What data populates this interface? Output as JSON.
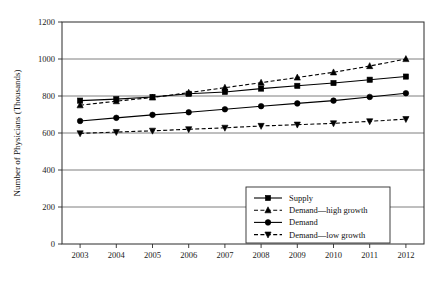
{
  "chart_data": {
    "type": "line",
    "title": "",
    "xlabel": "",
    "ylabel": "Number of Physicians (Thousands)",
    "categories": [
      2003,
      2004,
      2005,
      2006,
      2007,
      2008,
      2009,
      2010,
      2011,
      2012
    ],
    "x_tick_labels": [
      "2003",
      "2004",
      "2005",
      "2006",
      "2007",
      "2008",
      "2009",
      "2010",
      "2011",
      "2012"
    ],
    "y_tick_labels": [
      "0",
      "200",
      "400",
      "600",
      "800",
      "1000",
      "1200"
    ],
    "y_ticks": [
      0,
      200,
      400,
      600,
      800,
      1000,
      1200
    ],
    "ylim": [
      0,
      1200
    ],
    "grid": "horizontal",
    "legend_position": "inside-bottom-right",
    "series": [
      {
        "name": "Supply",
        "style": "solid",
        "marker": "square",
        "values": [
          775,
          783,
          795,
          812,
          822,
          840,
          855,
          870,
          888,
          905
        ]
      },
      {
        "name": "Demand—high growth",
        "style": "dashed",
        "marker": "triangle-up",
        "values": [
          750,
          772,
          792,
          818,
          845,
          872,
          900,
          928,
          962,
          1000
        ]
      },
      {
        "name": "Demand",
        "style": "solid",
        "marker": "circle",
        "values": [
          665,
          682,
          698,
          712,
          728,
          745,
          760,
          775,
          795,
          815
        ]
      },
      {
        "name": "Demand—low growth",
        "style": "dashed",
        "marker": "triangle-down",
        "values": [
          598,
          605,
          612,
          620,
          628,
          638,
          645,
          652,
          663,
          675
        ]
      }
    ]
  },
  "legend": {
    "entries": [
      {
        "label": "Supply"
      },
      {
        "label": "Demand—high growth"
      },
      {
        "label": "Demand"
      },
      {
        "label": "Demand—low growth"
      }
    ]
  },
  "colors": {
    "ink": "#000000",
    "grid": "#6f6f6f",
    "frame": "#2b2b2b",
    "background": "#ffffff"
  }
}
